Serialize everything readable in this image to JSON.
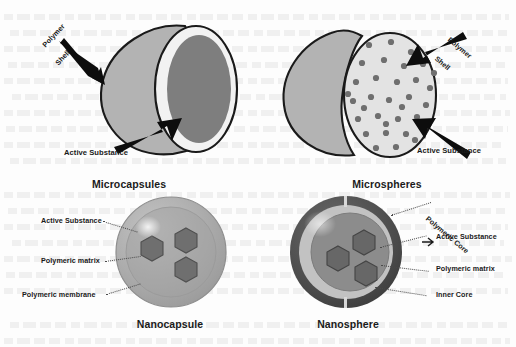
{
  "figure": {
    "title_implicit": "Types of polymeric carriers",
    "background_color": "#fdfdfd"
  },
  "palette": {
    "outline": "#1a1a1a",
    "text": "#1a1a1a",
    "caption": "#1b1b1b",
    "shell_light": "#d4d4d4",
    "sphere_mid": "#b3b3b3",
    "core_dark": "#7e7e7e",
    "ring_white": "#f2f2f2",
    "nano_body": "#a8a8a8",
    "nano_inner": "#9a9a9a",
    "hexagon": "#6f6f6f",
    "nanosphere_outer": "#4f4f4f",
    "nanosphere_ring": "#bdbdbd",
    "nanosphere_core": "#8c8c8c",
    "leader_line": "#4a4a4a",
    "dot_fill": "#6f6f6f"
  },
  "panels": [
    {
      "id": "microcapsules",
      "caption": "Microcapsules",
      "description": "Cut-away sphere with a single large reservoir core enclosed by a polymer shell",
      "labels": [
        {
          "name": "polymer-shell",
          "line1": "Polymer",
          "line2": "Shell",
          "pointer": "solid-arrow"
        },
        {
          "name": "active-substance",
          "text": "Active Substance",
          "pointer": "solid-arrow"
        }
      ]
    },
    {
      "id": "microspheres",
      "caption": "Microspheres",
      "description": "Cut-away sphere with active substance dispersed as many small particles through the matrix",
      "particle_count": 33,
      "labels": [
        {
          "name": "polymer-shell",
          "line1": "Polymer",
          "line2": "Shell",
          "pointer": "solid-arrow"
        },
        {
          "name": "active-substance",
          "text": "Active Substance",
          "pointer": "solid-arrow"
        }
      ]
    },
    {
      "id": "nanocapsule",
      "caption": "Nanocapsule",
      "description": "Sphere containing three hexagonal active-substance units within a polymeric matrix bounded by a membrane",
      "hexagon_count": 3,
      "labels": [
        {
          "name": "active-substance",
          "text": "Active Substance",
          "pointer": "dotted-leader"
        },
        {
          "name": "polymeric-matrix",
          "text": "Polymeric matrix",
          "pointer": "dotted-leader"
        },
        {
          "name": "polymeric-membrane",
          "text": "Polymeric membrane",
          "pointer": "dotted-leader"
        }
      ]
    },
    {
      "id": "nanosphere",
      "caption": "Nanosphere",
      "description": "Concentric layered sphere with polymeric core, inner core and three hexagonal active-substance units",
      "hexagon_count": 3,
      "labels": [
        {
          "name": "polymeric-core",
          "text": "Polymeric Core",
          "pointer": "dotted-leader"
        },
        {
          "name": "active-substance",
          "text": "Active Substance",
          "pointer": "dotted-leader"
        },
        {
          "name": "polymeric-matrix",
          "text": "Polymeric matrix",
          "pointer": "dotted-leader"
        },
        {
          "name": "inner-core",
          "text": "Inner Core",
          "pointer": "dotted-leader"
        }
      ]
    }
  ]
}
